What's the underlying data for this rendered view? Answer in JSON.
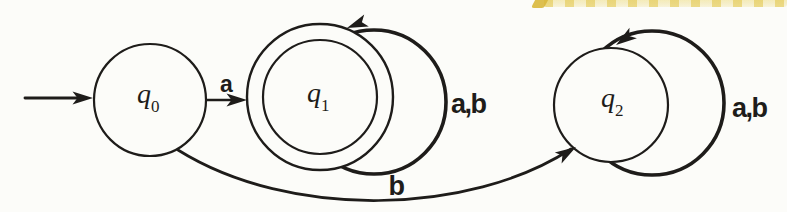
{
  "colors": {
    "ink": "#1e1c1a",
    "paper": "#fcfcf9",
    "highlight": "#d9b83c"
  },
  "automaton": {
    "states": [
      {
        "name": "q0",
        "label": "q",
        "subscript": "0",
        "initial": true,
        "accepting": false
      },
      {
        "name": "q1",
        "label": "q",
        "subscript": "1",
        "initial": false,
        "accepting": true
      },
      {
        "name": "q2",
        "label": "q",
        "subscript": "2",
        "initial": false,
        "accepting": false
      }
    ],
    "transitions": [
      {
        "from": "q0",
        "to": "q1",
        "label": "a"
      },
      {
        "from": "q1",
        "to": "q1",
        "label": "a,b"
      },
      {
        "from": "q0",
        "to": "q2",
        "label": "b"
      },
      {
        "from": "q2",
        "to": "q2",
        "label": "a,b"
      }
    ]
  },
  "annotations": {
    "highlighter_mark": "yellow highlighter streak, top right, cut off by image edge"
  }
}
